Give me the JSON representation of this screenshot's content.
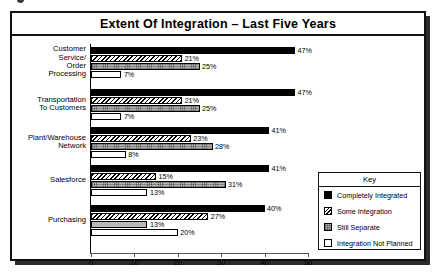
{
  "chart_data": {
    "type": "bar",
    "orientation": "horizontal",
    "title": "Extent Of Integration – Last Five Years",
    "xlabel": "",
    "ylabel": "",
    "xlim": [
      0,
      50
    ],
    "xticks": [
      0,
      10,
      20,
      30,
      40,
      50
    ],
    "grid": false,
    "legend_position": "bottom-right",
    "legend_title": "Key",
    "categories": [
      "Customer Service/ Order Processing",
      "Transportation To Customers",
      "Plant/Warehouse Network",
      "Salesforce",
      "Purchasing"
    ],
    "category_lines": [
      [
        "Customer",
        "Service/",
        "Order",
        "Processing"
      ],
      [
        "Transportation",
        "To Customers"
      ],
      [
        "Plant/Warehouse",
        "Network"
      ],
      [
        "Salesforce"
      ],
      [
        "Purchasing"
      ]
    ],
    "series": [
      {
        "name": "Completely Integrated",
        "values": [
          47,
          47,
          41,
          41,
          40
        ],
        "labels": [
          "47%",
          "47%",
          "41%",
          "41%",
          "40%"
        ]
      },
      {
        "name": "Some Integration",
        "values": [
          21,
          21,
          23,
          15,
          27
        ],
        "labels": [
          "21%",
          "21%",
          "23%",
          "15%",
          "27%"
        ]
      },
      {
        "name": "Still Separate",
        "values": [
          25,
          25,
          28,
          31,
          13
        ],
        "labels": [
          "25%",
          "25%",
          "28%",
          "31%",
          "13%"
        ]
      },
      {
        "name": "Integration Not Planned",
        "values": [
          7,
          7,
          8,
          13,
          20
        ],
        "labels": [
          "7%",
          "7%",
          "8%",
          "13%",
          "20%"
        ]
      }
    ]
  },
  "legend": {
    "title": "Key",
    "items": [
      {
        "label": "Completely Integrated"
      },
      {
        "label": "Some Integration"
      },
      {
        "label": "Still Separate"
      },
      {
        "label": "Integration Not Planned"
      }
    ]
  }
}
